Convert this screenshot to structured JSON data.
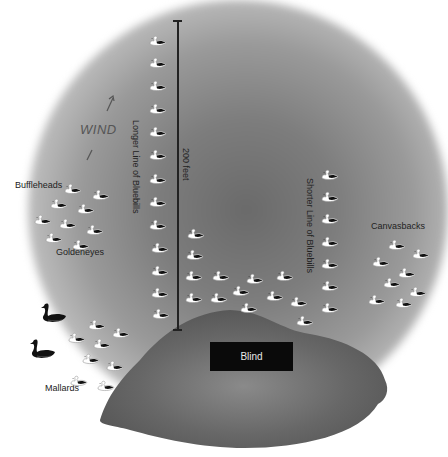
{
  "diagram": {
    "labels": {
      "wind": "WIND",
      "longer_line": "Longer Line of Bluebills",
      "shorter_line": "Shorter Line of Bluebills",
      "distance": "200 feet",
      "buffleheads": "Buffleheads",
      "goldeneyes": "Goldeneyes",
      "canvasbacks": "Canvasbacks",
      "mallards": "Mallards",
      "blind": "Blind"
    },
    "colors": {
      "water_center": "#6a6a6a",
      "land": "#5e5e5e",
      "blind_box": "#0a0a0a",
      "duck_body": "#ffffff",
      "duck_back": "#111111"
    },
    "decoy_groups": {
      "longer_line_of_bluebills": [
        [
          149,
          33
        ],
        [
          149,
          55
        ],
        [
          149,
          78
        ],
        [
          149,
          101
        ],
        [
          149,
          124
        ],
        [
          149,
          147
        ],
        [
          149,
          171
        ],
        [
          149,
          194
        ],
        [
          149,
          217
        ],
        [
          151,
          240
        ],
        [
          151,
          263
        ],
        [
          151,
          285
        ],
        [
          152,
          306
        ]
      ],
      "inner_bluebills": [
        [
          187,
          226
        ],
        [
          186,
          247
        ],
        [
          185,
          268
        ],
        [
          185,
          290
        ]
      ],
      "bluebill_cluster": [
        [
          212,
          268
        ],
        [
          210,
          290
        ],
        [
          232,
          283
        ],
        [
          246,
          271
        ],
        [
          240,
          300
        ],
        [
          266,
          288
        ],
        [
          276,
          268
        ],
        [
          290,
          294
        ],
        [
          296,
          313
        ]
      ],
      "shorter_line_of_bluebills": [
        [
          321,
          167
        ],
        [
          321,
          189
        ],
        [
          321,
          211
        ],
        [
          321,
          234
        ],
        [
          321,
          256
        ],
        [
          321,
          278
        ],
        [
          321,
          300
        ]
      ],
      "buffleheads": [
        [
          64,
          181
        ],
        [
          92,
          187
        ],
        [
          50,
          196
        ],
        [
          77,
          201
        ],
        [
          34,
          212
        ],
        [
          59,
          216
        ],
        [
          86,
          222
        ],
        [
          45,
          230
        ],
        [
          72,
          237
        ]
      ],
      "canvasbacks": [
        [
          388,
          237
        ],
        [
          412,
          246
        ],
        [
          372,
          254
        ],
        [
          398,
          265
        ],
        [
          383,
          275
        ],
        [
          409,
          284
        ],
        [
          368,
          292
        ],
        [
          395,
          295
        ]
      ],
      "mallard_decoys": [
        [
          88,
          317
        ],
        [
          112,
          325
        ],
        [
          68,
          330
        ],
        [
          93,
          336
        ],
        [
          82,
          351
        ],
        [
          106,
          358
        ],
        [
          70,
          373
        ],
        [
          97,
          378
        ]
      ],
      "mallard_drakes_black": [
        [
          40,
          302
        ],
        [
          29,
          338
        ]
      ]
    }
  }
}
